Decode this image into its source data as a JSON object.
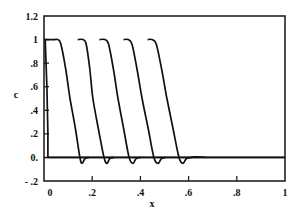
{
  "chart_data": {
    "type": "line",
    "title": "",
    "xlabel": "x",
    "ylabel": "c",
    "xlim": [
      0,
      1
    ],
    "ylim": [
      -0.2,
      1.2
    ],
    "grid": false,
    "legend": null,
    "x_ticks": [
      {
        "value": 0,
        "label": "0"
      },
      {
        "value": 0.2,
        "label": ".2"
      },
      {
        "value": 0.4,
        "label": ".4"
      },
      {
        "value": 0.6,
        "label": ".6"
      },
      {
        "value": 0.8,
        "label": ".8"
      },
      {
        "value": 1,
        "label": "1"
      }
    ],
    "y_ticks": [
      {
        "value": 1.2,
        "label": "1.2"
      },
      {
        "value": 1,
        "label": "1"
      },
      {
        "value": 0.8,
        "label": ".8"
      },
      {
        "value": 0.6,
        "label": ".6"
      },
      {
        "value": 0.4,
        "label": ".4"
      },
      {
        "value": 0.2,
        "label": ".2"
      },
      {
        "value": 0,
        "label": "0."
      },
      {
        "value": -0.2,
        "label": "- .2"
      }
    ],
    "reference_lines": [
      {
        "axis": "y",
        "value": 0
      }
    ],
    "series": [
      {
        "name": "initial step",
        "x": [
          0,
          0.005,
          0.012,
          0.016,
          0.016,
          1.0
        ],
        "y": [
          1,
          1,
          0.6,
          0.2,
          0,
          0
        ]
      },
      {
        "name": "profile 1",
        "x": [
          0,
          0.04,
          0.058,
          0.07,
          0.09,
          0.108,
          0.13,
          0.149,
          0.158,
          0.17,
          0.185
        ],
        "y": [
          1,
          1.0,
          1.0,
          0.96,
          0.75,
          0.5,
          0.25,
          0.0,
          -0.05,
          -0.01,
          0
        ]
      },
      {
        "name": "profile 2",
        "x": [
          0.14,
          0.162,
          0.175,
          0.19,
          0.203,
          0.225,
          0.249,
          0.261,
          0.273,
          0.29
        ],
        "y": [
          1.0,
          1.0,
          0.96,
          0.75,
          0.5,
          0.25,
          0.0,
          -0.05,
          -0.01,
          0
        ]
      },
      {
        "name": "profile 3",
        "x": [
          0.23,
          0.253,
          0.268,
          0.288,
          0.307,
          0.33,
          0.353,
          0.369,
          0.382,
          0.4
        ],
        "y": [
          1.0,
          1.0,
          0.96,
          0.75,
          0.5,
          0.25,
          0.0,
          -0.05,
          -0.01,
          0
        ]
      },
      {
        "name": "profile 4",
        "x": [
          0.33,
          0.349,
          0.365,
          0.386,
          0.407,
          0.432,
          0.456,
          0.473,
          0.487,
          0.505
        ],
        "y": [
          1.0,
          1.0,
          0.96,
          0.75,
          0.5,
          0.25,
          0.0,
          -0.05,
          -0.01,
          0
        ]
      },
      {
        "name": "profile 5",
        "x": [
          0.43,
          0.448,
          0.466,
          0.488,
          0.51,
          0.535,
          0.56,
          0.577,
          0.592,
          0.63,
          0.67
        ],
        "y": [
          1.0,
          1.0,
          0.96,
          0.75,
          0.5,
          0.25,
          0.0,
          -0.05,
          -0.01,
          0.005,
          0
        ]
      }
    ]
  },
  "style": {
    "line_color": "#111111",
    "axis_color": "#222222",
    "background": "#ffffff"
  }
}
